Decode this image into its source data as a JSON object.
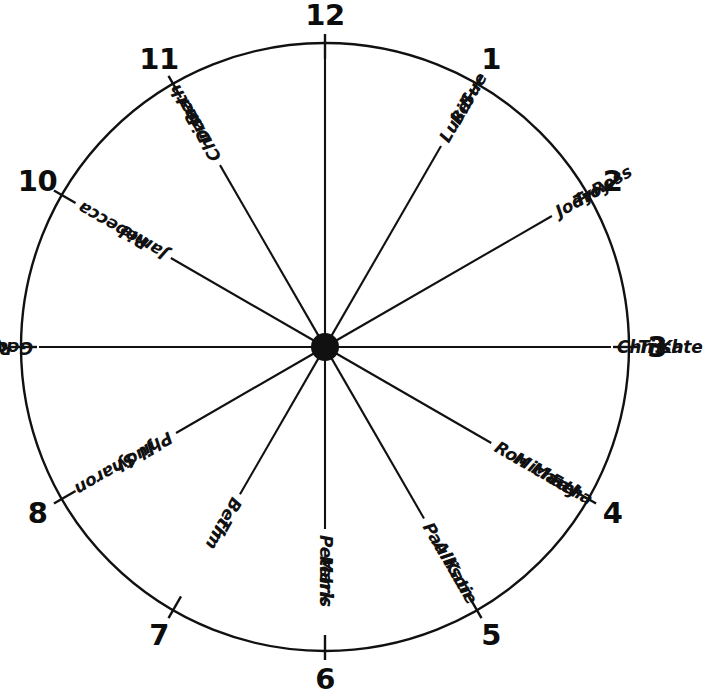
{
  "figure": {
    "ink_color": "#111111",
    "background_color": "#ffffff",
    "hub_color": "#111111"
  },
  "geometry": {
    "center_x": 325,
    "center_y": 347,
    "radius": 304,
    "hub_radius": 14,
    "numeral_radius": 332,
    "tick_inner_radius": 288,
    "tick_outer_radius": 313
  },
  "chart_data": {
    "type": "diagram",
    "hours": [
      {
        "hour": "12",
        "angle_deg": 0,
        "spoke_length": 288,
        "names": []
      },
      {
        "hour": "1",
        "angle_deg": 30,
        "spoke_length": 232,
        "names": [
          "Luke",
          "Bill",
          "Sue"
        ]
      },
      {
        "hour": "2",
        "angle_deg": 60,
        "spoke_length": 262,
        "names": [
          "Jody",
          "Troy",
          "Ross"
        ]
      },
      {
        "hour": "3",
        "angle_deg": 90,
        "spoke_length": 286,
        "names": [
          "Chris",
          "Trish",
          "Kate"
        ]
      },
      {
        "hour": "4",
        "angle_deg": 120,
        "spoke_length": 192,
        "names": [
          "Ron",
          "Michael",
          "Martha",
          "Fay"
        ]
      },
      {
        "hour": "5",
        "angle_deg": 150,
        "spoke_length": 198,
        "names": [
          "Paul",
          "Allison",
          "Katie"
        ]
      },
      {
        "hour": "6",
        "angle_deg": 180,
        "spoke_length": 182,
        "names": [
          "Peter",
          "Mark",
          "Iris"
        ]
      },
      {
        "hour": "7",
        "angle_deg": 210,
        "spoke_length": 170,
        "names": [
          "Beth",
          "Tim"
        ]
      },
      {
        "hour": "8",
        "angle_deg": 240,
        "spoke_length": 172,
        "names": [
          "Phil",
          "Judy",
          "Sharon"
        ]
      },
      {
        "hour": "9",
        "angle_deg": 270,
        "spoke_length": 286,
        "names": [
          "George",
          "Ruby",
          "Harry"
        ]
      },
      {
        "hour": "10",
        "angle_deg": 300,
        "spoke_length": 178,
        "names": [
          "Jamie",
          "Rebecca"
        ]
      },
      {
        "hour": "11",
        "angle_deg": 330,
        "spoke_length": 210,
        "names": [
          "Chrissa",
          "Dan",
          "Beth"
        ]
      }
    ]
  }
}
